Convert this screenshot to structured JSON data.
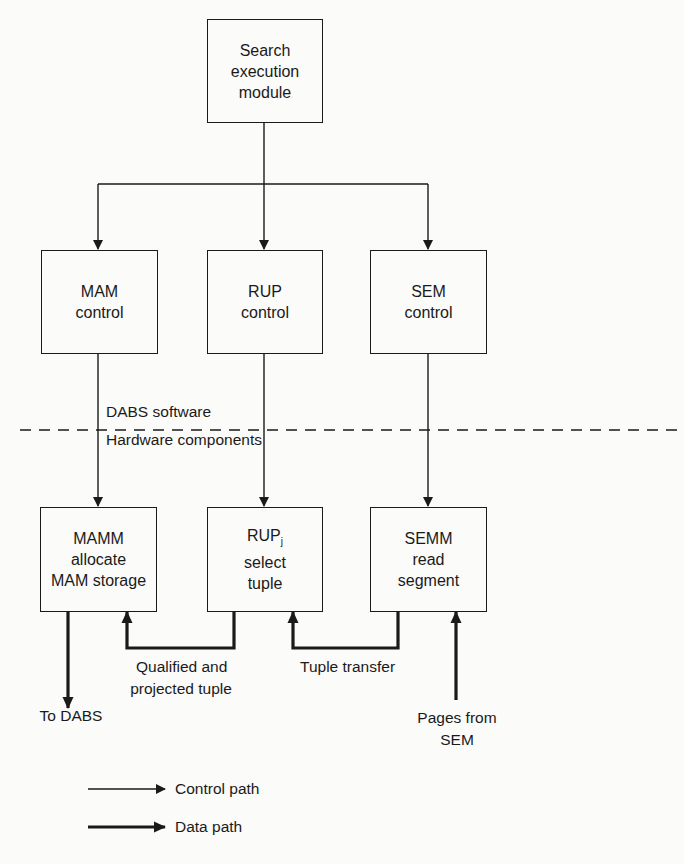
{
  "diagram": {
    "top": {
      "line1": "Search",
      "line2": "execution",
      "line3": "module"
    },
    "control_boxes": [
      {
        "line1": "MAM",
        "line2": "control"
      },
      {
        "line1": "RUP",
        "line2": "control"
      },
      {
        "line1": "SEM",
        "line2": "control"
      }
    ],
    "divider": {
      "above": "DABS software",
      "below": "Hardware components"
    },
    "hardware_boxes": [
      {
        "line1": "MAMM",
        "line2": "allocate",
        "line3": "MAM storage"
      },
      {
        "line1": "RUP",
        "sub": "j",
        "line2": "select",
        "line3": "tuple"
      },
      {
        "line1": "SEMM",
        "line2": "read",
        "line3": "segment"
      }
    ],
    "data_labels": {
      "qualified_1": "Qualified and",
      "qualified_2": "projected tuple",
      "tuple_transfer": "Tuple transfer",
      "to_dabs": "To DABS",
      "pages_1": "Pages from",
      "pages_2": "SEM"
    },
    "legend": {
      "control": "Control path",
      "data": "Data path"
    }
  }
}
